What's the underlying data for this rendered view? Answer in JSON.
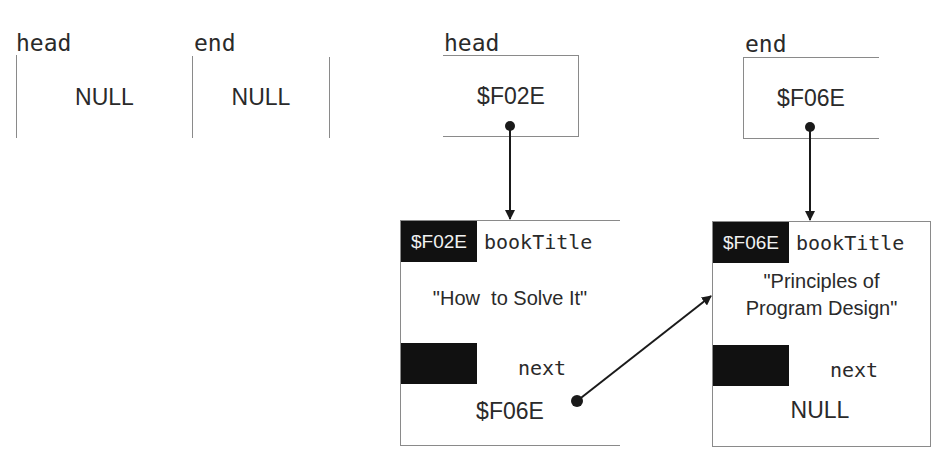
{
  "empty_list": {
    "head": {
      "label": "head",
      "value": "NULL"
    },
    "end": {
      "label": "end",
      "value": "NULL"
    }
  },
  "populated_list": {
    "head": {
      "label": "head",
      "value": "$F02E"
    },
    "end": {
      "label": "end",
      "value": "$F06E"
    },
    "nodes": [
      {
        "address": "$F02E",
        "title_field": "bookTitle",
        "title_value": "\"How  to Solve It\"",
        "next_field": "next",
        "next_value": "$F06E"
      },
      {
        "address": "$F06E",
        "title_field": "bookTitle",
        "title_value_line1": "\"Principles of",
        "title_value_line2": "Program Design\"",
        "next_field": "next",
        "next_value": "NULL"
      }
    ]
  },
  "colors": {
    "border": "#8a8a8a",
    "arrow": "#1a1a1a",
    "address_block": "#111111",
    "text": "#2a2a2a"
  }
}
